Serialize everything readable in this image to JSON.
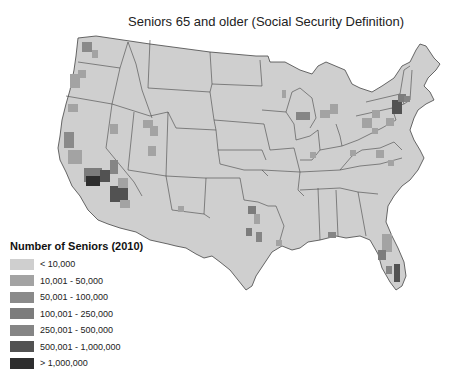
{
  "title": "Seniors 65 and older (Social Security Definition)",
  "legend": {
    "title": "Number of Seniors (2010)",
    "items": [
      {
        "label": "< 10,000",
        "color": "#cfcfcf"
      },
      {
        "label": "10,001 - 50,000",
        "color": "#a3a3a3"
      },
      {
        "label": "50,001 - 100,000",
        "color": "#8a8a8a"
      },
      {
        "label": "100,001 - 250,000",
        "color": "#7c7c7c"
      },
      {
        "label": "250,001 - 500,000",
        "color": "#858585"
      },
      {
        "label": "500,001 - 1,000,000",
        "color": "#525252"
      },
      {
        "label": "> 1,000,000",
        "color": "#2e2e2e"
      }
    ]
  },
  "map": {
    "region": "Contiguous United States",
    "unit": "county",
    "base_color": "#cfcfcf",
    "border_color": "#333333",
    "highlighted_areas": [
      {
        "name": "Southern California",
        "class": "> 1,000,000"
      },
      {
        "name": "Phoenix area",
        "class": "500,001 - 1,000,000"
      },
      {
        "name": "Las Vegas area",
        "class": "250,001 - 500,000"
      },
      {
        "name": "South Florida",
        "class": "250,001 - 500,000"
      },
      {
        "name": "New York metro",
        "class": "500,001 - 1,000,000"
      },
      {
        "name": "Chicago area",
        "class": "250,001 - 500,000"
      },
      {
        "name": "Seattle area",
        "class": "100,001 - 250,000"
      },
      {
        "name": "Dallas / Houston",
        "class": "100,001 - 250,000"
      }
    ]
  }
}
